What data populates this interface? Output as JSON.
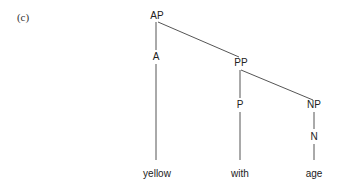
{
  "panel_label": "(c)",
  "tree": {
    "nodes": {
      "ap": "AP",
      "a": "A",
      "pp": "PP",
      "p": "P",
      "np": "NP",
      "n": "N"
    },
    "leaves": {
      "yellow": "yellow",
      "with": "with",
      "age": "age"
    },
    "edges": [
      [
        "AP",
        "A"
      ],
      [
        "AP",
        "PP"
      ],
      [
        "A",
        "yellow"
      ],
      [
        "PP",
        "P"
      ],
      [
        "PP",
        "NP"
      ],
      [
        "P",
        "with"
      ],
      [
        "NP",
        "N"
      ],
      [
        "N",
        "age"
      ]
    ]
  },
  "colors": {
    "line": "#555555",
    "text": "#222222"
  }
}
